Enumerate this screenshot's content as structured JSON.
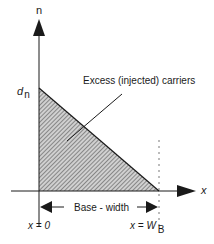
{
  "diagram": {
    "y_axis_label": "n",
    "x_axis_label": "x",
    "intercept_label_main": "d",
    "intercept_label_sub": "n",
    "region_label": "Excess (injected) carriers",
    "width_label": "Base - width",
    "origin_label": "x = 0",
    "end_label_main": "x = W",
    "end_label_sub": "B",
    "colors": {
      "ink": "#1a1a1a",
      "hatch": "#555555",
      "background": "#ffffff"
    }
  }
}
